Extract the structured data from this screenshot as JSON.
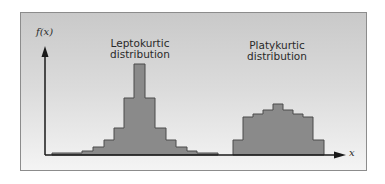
{
  "chart_data": {
    "type": "bar",
    "title": "",
    "xlabel": "x",
    "ylabel": "f(x)",
    "grid": false,
    "legend": null,
    "annotations": [
      "Leptokurtic distribution",
      "Platykurtic distribution"
    ],
    "series": [
      {
        "name": "Leptokurtic distribution",
        "bins": [
          {
            "x0": 52,
            "x1": 82,
            "height": 2
          },
          {
            "x0": 82,
            "x1": 93,
            "height": 4
          },
          {
            "x0": 93,
            "x1": 104,
            "height": 8
          },
          {
            "x0": 104,
            "x1": 114,
            "height": 15
          },
          {
            "x0": 114,
            "x1": 124,
            "height": 27
          },
          {
            "x0": 124,
            "x1": 134,
            "height": 57
          },
          {
            "x0": 134,
            "x1": 145,
            "height": 91
          },
          {
            "x0": 145,
            "x1": 155,
            "height": 57
          },
          {
            "x0": 155,
            "x1": 166,
            "height": 27
          },
          {
            "x0": 166,
            "x1": 176,
            "height": 15
          },
          {
            "x0": 176,
            "x1": 187,
            "height": 8
          },
          {
            "x0": 187,
            "x1": 197,
            "height": 4
          },
          {
            "x0": 197,
            "x1": 218,
            "height": 2
          }
        ]
      },
      {
        "name": "Platykurtic distribution",
        "bins": [
          {
            "x0": 233,
            "x1": 243,
            "height": 15
          },
          {
            "x0": 243,
            "x1": 253,
            "height": 38
          },
          {
            "x0": 253,
            "x1": 263,
            "height": 41
          },
          {
            "x0": 263,
            "x1": 273,
            "height": 45
          },
          {
            "x0": 273,
            "x1": 283,
            "height": 51
          },
          {
            "x0": 283,
            "x1": 293,
            "height": 45
          },
          {
            "x0": 293,
            "x1": 303,
            "height": 41
          },
          {
            "x0": 303,
            "x1": 313,
            "height": 38
          },
          {
            "x0": 313,
            "x1": 324,
            "height": 15
          }
        ]
      }
    ],
    "colors": {
      "bar_fill": "#8a8a8a",
      "bar_stroke": "#4a4a4a",
      "axis": "#1a1a1a"
    }
  },
  "labels": {
    "y_axis": "f(x)",
    "x_axis": "x",
    "lepto_line1": "Leptokurtic",
    "lepto_line2": "distribution",
    "platy_line1": "Platykurtic",
    "platy_line2": "distribution"
  }
}
